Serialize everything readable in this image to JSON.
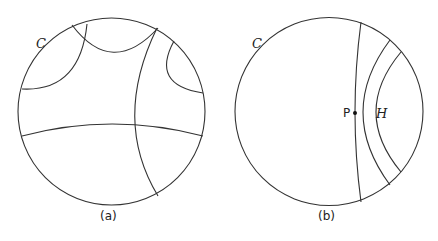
{
  "figure": {
    "panels": [
      {
        "id": "a",
        "caption": "(a)",
        "circle_label": "C"
      },
      {
        "id": "b",
        "caption": "(b)",
        "circle_label": "C",
        "point_label": "P",
        "region_label": "H"
      }
    ]
  },
  "colors": {
    "stroke": "#333333",
    "background": "#ffffff"
  }
}
